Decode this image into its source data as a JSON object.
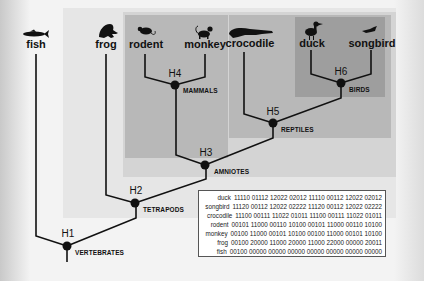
{
  "taxa": {
    "fish": "fish",
    "frog": "frog",
    "rodent": "rodent",
    "monkey": "monkey",
    "crocodile": "crocodile",
    "duck": "duck",
    "songbird": "songbird"
  },
  "nodes": {
    "h1": "H1",
    "h2": "H2",
    "h3": "H3",
    "h4": "H4",
    "h5": "H5",
    "h6": "H6"
  },
  "clades": {
    "vertebrates": "VERTEBRATES",
    "tetrapods": "TETRAPODS",
    "amniotes": "AMNIOTES",
    "mammals": "MAMMALS",
    "reptiles": "REPTILES",
    "birds": "BIRDS"
  },
  "colors": {
    "page": "#f3f3f3",
    "tetrapods_panel": "#e6e6e6",
    "amniotes_panel": "#d4d4d4",
    "mammals_panel": "#b8b8b8",
    "reptiles_panel": "#b8b8b8",
    "birds_panel": "#9e9e9e",
    "branch": "#111111"
  },
  "matrix": {
    "rows": [
      {
        "name": "duck",
        "codes": "11110 01112 12022 02012 11110 00112 12022 02012"
      },
      {
        "name": "songbird",
        "codes": "11120 00112 12022 02222 11120 00112 12022 02222"
      },
      {
        "name": "crocodile",
        "codes": "11100 00111 11022 01011 11100 00111 11022 01011"
      },
      {
        "name": "rodent",
        "codes": "00101 11000 00110 10100 00101 11000 00110 10100"
      },
      {
        "name": "monkey",
        "codes": "00100 11000 00101 10100 00100 11000 00101 10100"
      },
      {
        "name": "frog",
        "codes": "00100 20000 11000 20000 11000 22000 00000 20011"
      },
      {
        "name": "fish",
        "codes": "00100 00000 00000 00000 00000 00000 00000 00000"
      }
    ]
  }
}
